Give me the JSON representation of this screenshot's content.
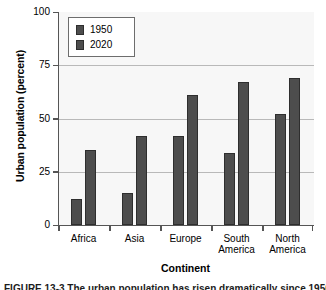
{
  "chart_data": {
    "type": "bar",
    "title": "",
    "xlabel": "Continent",
    "ylabel": "Urban population (percent)",
    "categories": [
      "Africa",
      "Asia",
      "Europe",
      "South\nAmerica",
      "North\nAmerica"
    ],
    "series": [
      {
        "name": "1950",
        "values": [
          12,
          15,
          42,
          34,
          52
        ],
        "color": "#4d4d4d"
      },
      {
        "name": "2020",
        "values": [
          35,
          42,
          61,
          67,
          69
        ],
        "color": "#4d4d4d"
      }
    ],
    "ylim": [
      0,
      100
    ],
    "yticks": [
      0,
      25,
      50,
      75,
      100
    ],
    "ytick_labels": [
      "0",
      "25",
      "50",
      "75",
      "100"
    ],
    "grid": true,
    "grid_axis": "y",
    "legend_position": "upper left",
    "plot_background": "#f7f7f7",
    "axis_color": "#555555",
    "grid_color": "#b9b9b9",
    "bar_edge_color": "#2e2e2e"
  },
  "caption": {
    "text": "FIGURE 13-3  The urban population has risen dramatically since 1950"
  }
}
